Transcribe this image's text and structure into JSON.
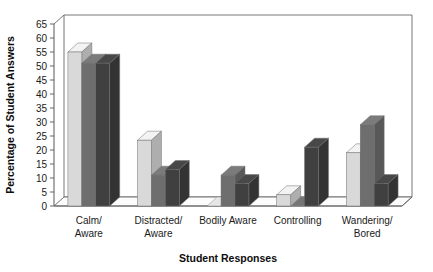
{
  "chart_data": {
    "type": "bar",
    "title": "",
    "subtitle": "",
    "xlabel": "Student Responses",
    "ylabel": "Percentage of Student Answers",
    "categories": [
      "Calm/\nAware",
      "Distracted/\nAware",
      "Bodily Aware",
      "Controlling",
      "Wandering/\nBored"
    ],
    "category_lines": [
      [
        "Calm/",
        "Aware"
      ],
      [
        "Distracted/",
        "Aware"
      ],
      [
        "Bodily Aware",
        ""
      ],
      [
        "Controlling",
        ""
      ],
      [
        "Wandering/",
        "Bored"
      ]
    ],
    "series": [
      {
        "name": "series-1",
        "color": "#d9d9d9",
        "values": [
          55,
          23.5,
          0,
          4,
          19
        ]
      },
      {
        "name": "series-2",
        "color": "#6e6e6e",
        "values": [
          51,
          11,
          11,
          0,
          29
        ]
      },
      {
        "name": "series-3",
        "color": "#404040",
        "values": [
          51,
          13,
          8,
          21,
          8
        ]
      }
    ],
    "ylim": [
      0,
      65
    ],
    "yticks": [
      0,
      5,
      10,
      15,
      20,
      25,
      30,
      35,
      40,
      45,
      50,
      55,
      60,
      65
    ],
    "ytick_labels": [
      "0",
      "5",
      "10",
      "15",
      "20",
      "25",
      "30",
      "35",
      "40",
      "45",
      "50",
      "55",
      "60",
      "65"
    ],
    "grid": false,
    "legend": "none",
    "style": "3d-bars",
    "colors": {
      "axis": "#666666",
      "text": "#1a1a1a",
      "plot_background": "#ffffff",
      "bar_light": "#d9d9d9",
      "bar_mid": "#6e6e6e",
      "bar_dark": "#404040"
    }
  }
}
